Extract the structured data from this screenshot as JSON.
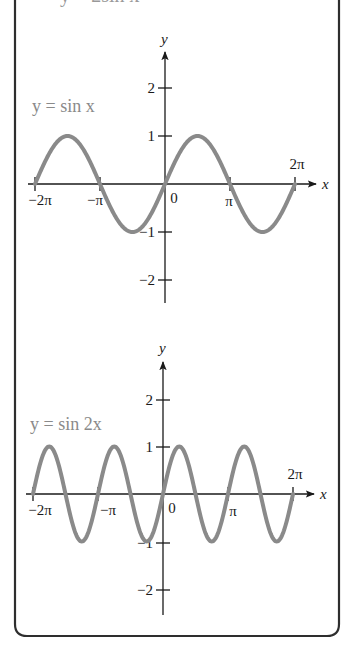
{
  "header": {
    "cut_off_text": "y = 2sin x"
  },
  "colors": {
    "curve": "#8a8a8a",
    "label": "#8a8a8a",
    "axis": "#1a1a1a",
    "border": "#2e2e2e",
    "background": "#ffffff"
  },
  "top_graph": {
    "function_label": "y = sin x",
    "y_axis_label": "y",
    "x_axis_label": "x",
    "x_ticks": [
      "−2π",
      "−π",
      "0",
      "π",
      "2π"
    ],
    "y_ticks": [
      "2",
      "1",
      "−1",
      "−2"
    ]
  },
  "bottom_graph": {
    "function_label": "y = sin 2x",
    "y_axis_label": "y",
    "x_axis_label": "x",
    "x_ticks": [
      "−2π",
      "−π",
      "0",
      "π",
      "2π"
    ],
    "y_ticks": [
      "2",
      "1",
      "−1",
      "−2"
    ]
  },
  "chart_data": [
    {
      "type": "line",
      "title": "y = sin x",
      "xlabel": "x",
      "ylabel": "y",
      "xlim": [
        -6.2832,
        6.2832
      ],
      "ylim": [
        -2,
        2
      ],
      "x_tick_labels": [
        "−2π",
        "−π",
        "0",
        "π",
        "2π"
      ],
      "y_tick_labels": [
        "−2",
        "−1",
        "1",
        "2"
      ],
      "grid": false,
      "series": [
        {
          "name": "y = sin x",
          "x": [
            -6.2832,
            -4.7124,
            -3.1416,
            -1.5708,
            0,
            1.5708,
            3.1416,
            4.7124,
            6.2832
          ],
          "values": [
            0,
            1,
            0,
            -1,
            0,
            1,
            0,
            -1,
            0
          ]
        }
      ]
    },
    {
      "type": "line",
      "title": "y = sin 2x",
      "xlabel": "x",
      "ylabel": "y",
      "xlim": [
        -6.2832,
        6.2832
      ],
      "ylim": [
        -2,
        2
      ],
      "x_tick_labels": [
        "−2π",
        "−π",
        "0",
        "π",
        "2π"
      ],
      "y_tick_labels": [
        "−2",
        "−1",
        "1",
        "2"
      ],
      "grid": false,
      "series": [
        {
          "name": "y = sin 2x",
          "x": [
            -6.2832,
            -5.4978,
            -4.7124,
            -3.927,
            -3.1416,
            -2.3562,
            -1.5708,
            -0.7854,
            0,
            0.7854,
            1.5708,
            2.3562,
            3.1416,
            3.927,
            4.7124,
            5.4978,
            6.2832
          ],
          "values": [
            0,
            1,
            0,
            -1,
            0,
            1,
            0,
            -1,
            0,
            1,
            0,
            -1,
            0,
            1,
            0,
            -1,
            0
          ]
        }
      ]
    }
  ]
}
